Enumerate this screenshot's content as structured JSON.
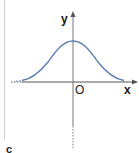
{
  "diagram": {
    "type": "function-graph",
    "labels": {
      "y_axis": "y",
      "x_axis": "x",
      "origin": "O",
      "panel": "c"
    },
    "colors": {
      "curve": "#5b7fb5",
      "axes": "#555555",
      "border": "#cfcfcf"
    }
  }
}
